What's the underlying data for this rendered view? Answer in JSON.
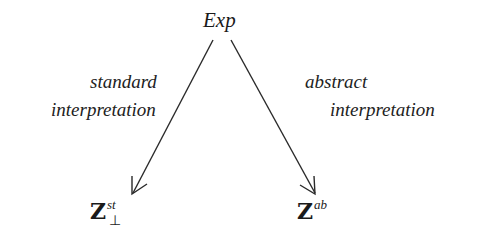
{
  "diagram": {
    "type": "commutative-diagram",
    "nodes": {
      "source": {
        "label": "Exp"
      },
      "standard_target": {
        "base": "Z",
        "superscript": "st",
        "subscript_symbol": "⊥"
      },
      "abstract_target": {
        "base": "Z",
        "superscript": "ab"
      }
    },
    "edges": {
      "standard": {
        "from": "source",
        "to": "standard_target",
        "label_line1": "standard",
        "label_line2": "interpretation"
      },
      "abstract": {
        "from": "source",
        "to": "abstract_target",
        "label_line1": "abstract",
        "label_line2": "interpretation"
      }
    },
    "colors": {
      "stroke": "#2a2a2a",
      "text": "#1a1a1a",
      "background": "#ffffff"
    }
  }
}
